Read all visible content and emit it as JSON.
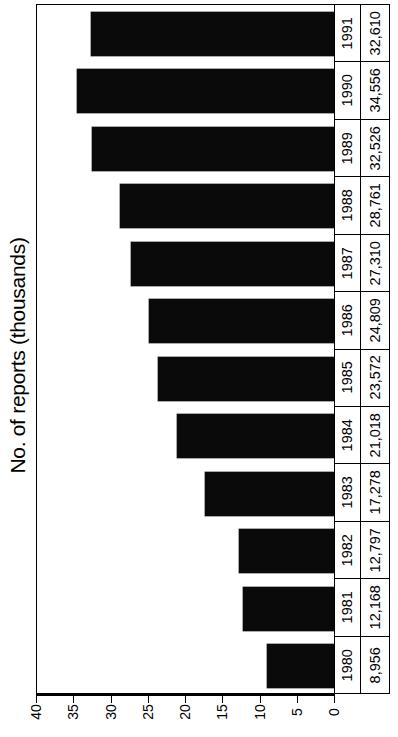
{
  "chart_data": {
    "type": "bar",
    "orientation": "horizontal",
    "title": "",
    "xlabel": "",
    "ylabel": "No. of reports (thousands)",
    "value_axis_label": "No. of reports (thousands)",
    "grid": false,
    "legend": null,
    "axis_ticks": [
      "40",
      "35",
      "30",
      "25",
      "20",
      "15",
      "10",
      "5",
      "0"
    ],
    "axis_tick_values": [
      40,
      35,
      30,
      25,
      20,
      15,
      10,
      5,
      0
    ],
    "axis_range": [
      0,
      40
    ],
    "axis_direction": "0 at right, 40 at left",
    "categories": [
      "1991",
      "1990",
      "1989",
      "1988",
      "1987",
      "1986",
      "1985",
      "1984",
      "1983",
      "1982",
      "1981",
      "1980"
    ],
    "values": [
      32.61,
      34.556,
      32.526,
      28.761,
      27.31,
      24.809,
      23.572,
      21.018,
      17.278,
      12.797,
      12.168,
      8.956
    ],
    "value_labels": [
      "32,610",
      "34,556",
      "32,526",
      "28,761",
      "27,310",
      "24,809",
      "23,572",
      "21,018",
      "17,278",
      "12,797",
      "12,168",
      "8,956"
    ],
    "bar_color": "#0a0a0a",
    "rows": [
      {
        "year": "1991",
        "value_label": "32,610",
        "value": 32.61
      },
      {
        "year": "1990",
        "value_label": "34,556",
        "value": 34.556
      },
      {
        "year": "1989",
        "value_label": "32,526",
        "value": 32.526
      },
      {
        "year": "1988",
        "value_label": "28,761",
        "value": 28.761
      },
      {
        "year": "1987",
        "value_label": "27,310",
        "value": 27.31
      },
      {
        "year": "1986",
        "value_label": "24,809",
        "value": 24.809
      },
      {
        "year": "1985",
        "value_label": "23,572",
        "value": 23.572
      },
      {
        "year": "1984",
        "value_label": "21,018",
        "value": 21.018
      },
      {
        "year": "1983",
        "value_label": "17,278",
        "value": 17.278
      },
      {
        "year": "1982",
        "value_label": "12,797",
        "value": 12.797
      },
      {
        "year": "1981",
        "value_label": "12,168",
        "value": 12.168
      },
      {
        "year": "1980",
        "value_label": "8,956",
        "value": 8.956
      }
    ]
  },
  "axis": {
    "title": "No. of reports (thousands)",
    "ticks": [
      "40",
      "35",
      "30",
      "25",
      "20",
      "15",
      "10",
      "5",
      "0"
    ]
  },
  "table": {
    "year_column": [
      "1991",
      "1990",
      "1989",
      "1988",
      "1987",
      "1986",
      "1985",
      "1984",
      "1983",
      "1982",
      "1981",
      "1980"
    ],
    "value_column": [
      "32,610",
      "34,556",
      "32,526",
      "28,761",
      "27,310",
      "24,809",
      "23,572",
      "21,018",
      "17,278",
      "12,797",
      "12,168",
      "8,956"
    ]
  }
}
